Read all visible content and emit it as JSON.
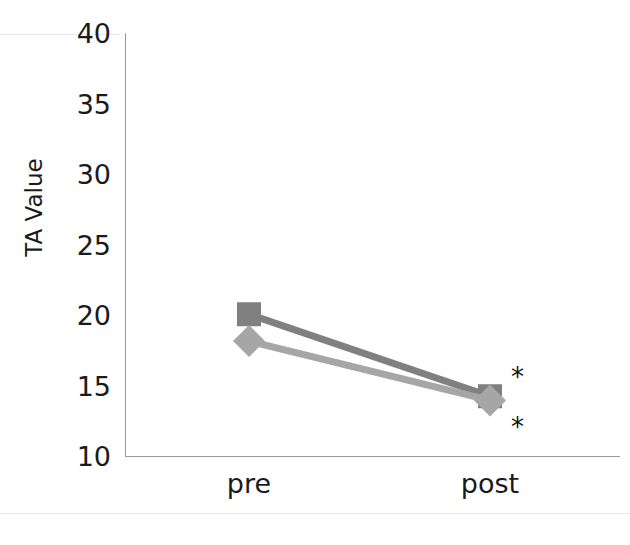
{
  "chart_data": {
    "type": "line",
    "title": "",
    "subtitle": "",
    "xlabel": "",
    "ylabel": "TA Value",
    "categories": [
      "pre",
      "post"
    ],
    "series": [
      {
        "name": "series-1",
        "marker": "square",
        "color": "#808080",
        "values": [
          20.1,
          14.3
        ]
      },
      {
        "name": "series-2",
        "marker": "diamond",
        "color": "#a6a6a6",
        "values": [
          18.2,
          14.0
        ]
      }
    ],
    "ylim": [
      10,
      40
    ],
    "yticks": [
      40,
      35,
      30,
      25,
      20,
      15,
      10
    ],
    "ytick_labels": [
      "40",
      "35",
      "30",
      "25",
      "20",
      "15",
      "10"
    ],
    "xtick_labels": [
      "pre",
      "post"
    ],
    "grid": false,
    "legend": "none",
    "annotations": [
      {
        "text": "*",
        "x": "post",
        "y": 15.4,
        "name": "significance-star-upper"
      },
      {
        "text": "*",
        "x": "post",
        "y": 12.2,
        "name": "significance-star-lower"
      }
    ]
  },
  "axis": {
    "y_title": "TA Value",
    "ticks": [
      {
        "label": "40",
        "value": 40
      },
      {
        "label": "35",
        "value": 35
      },
      {
        "label": "30",
        "value": 30
      },
      {
        "label": "25",
        "value": 25
      },
      {
        "label": "20",
        "value": 20
      },
      {
        "label": "15",
        "value": 15
      },
      {
        "label": "10",
        "value": 10
      }
    ],
    "x_ticks": [
      {
        "label": "pre"
      },
      {
        "label": "post"
      }
    ]
  },
  "annotations": {
    "star_upper": "*",
    "star_lower": "*"
  },
  "caption": {
    "clipped_text": ""
  },
  "colors": {
    "series_1": "#808080",
    "series_2": "#a6a6a6",
    "axis": "#9a9a9a",
    "text": "#1a1a1a",
    "background": "#ffffff"
  }
}
